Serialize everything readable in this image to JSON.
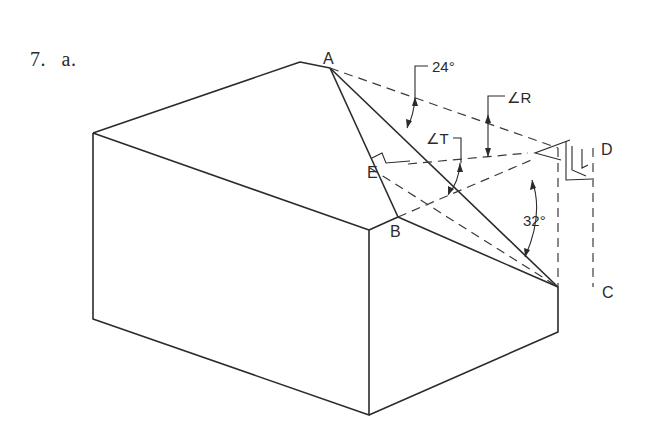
{
  "problem": {
    "number": "7.",
    "part": "a."
  },
  "diagram": {
    "points": {
      "A": "A",
      "B": "B",
      "C": "C",
      "D": "D",
      "E": "E"
    },
    "angles": {
      "angle_24": "24°",
      "angle_R": "∠R",
      "angle_T": "∠T",
      "angle_32": "32°"
    },
    "colors": {
      "line": "#2b2b2b",
      "background": "#ffffff"
    }
  }
}
